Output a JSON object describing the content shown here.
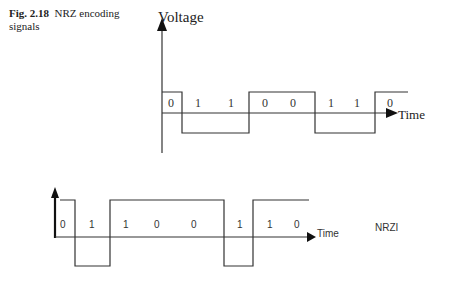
{
  "caption": {
    "figure_number": "Fig. 2.18",
    "text": "NRZ encoding signals"
  },
  "nrz": {
    "y_axis_label": "Voltage",
    "x_axis_label": "Time",
    "bits": [
      "0",
      "1",
      "1",
      "0",
      "0",
      "1",
      "1",
      "0"
    ]
  },
  "nrzi": {
    "x_axis_label": "Time",
    "label": "NRZI",
    "bits": [
      "0",
      "1",
      "1",
      "0",
      "0",
      "1",
      "1",
      "0"
    ]
  }
}
